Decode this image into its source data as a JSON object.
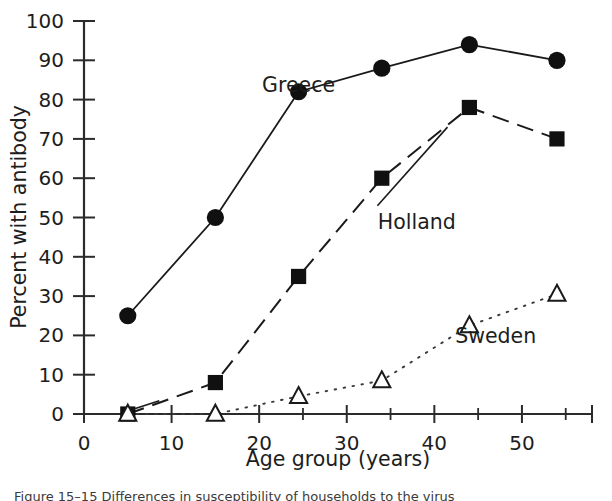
{
  "chart_data": {
    "type": "line",
    "title": "",
    "xlabel": "Age group (years)",
    "ylabel": "Percent with antibody",
    "xlim": [
      0,
      58
    ],
    "ylim": [
      0,
      100
    ],
    "grid": false,
    "legend_position": "inline-annotations",
    "x": [
      5,
      15,
      24.5,
      34,
      44,
      54
    ],
    "xticks_major": [
      0,
      10,
      20,
      30,
      40,
      50
    ],
    "xticks_minor": [
      5,
      15,
      25,
      35,
      45,
      55
    ],
    "xticklabels": [
      "0",
      "10",
      "20",
      "30",
      "40",
      "50"
    ],
    "yticks": [
      0,
      10,
      20,
      30,
      40,
      50,
      60,
      70,
      80,
      90,
      100
    ],
    "yticklabels": [
      "0",
      "10",
      "20",
      "30",
      "40",
      "50",
      "60",
      "70",
      "80",
      "90",
      "100"
    ],
    "series": [
      {
        "name": "Greece",
        "marker": "filled-circle",
        "linestyle": "solid",
        "color": "#101010",
        "values": [
          25,
          50,
          82,
          88,
          94,
          90
        ],
        "label_x": 24.5,
        "label_y": 82,
        "annotation": "Greece"
      },
      {
        "name": "Holland",
        "marker": "filled-square",
        "linestyle": "dashed",
        "color": "#101010",
        "values": [
          0,
          8,
          35,
          60,
          78,
          70
        ],
        "label_x": 38,
        "label_y": 47,
        "annotation": "Holland"
      },
      {
        "name": "Sweden",
        "marker": "open-triangle",
        "linestyle": "dotted",
        "color": "#1a1a1a",
        "values": [
          0,
          0,
          4.5,
          8.5,
          22.5,
          30.5
        ],
        "label_x": 47,
        "label_y": 18,
        "annotation": "Sweden"
      }
    ]
  },
  "caption": {
    "text": "Figure 15–15  Differences in susceptibility of households to the virus"
  }
}
